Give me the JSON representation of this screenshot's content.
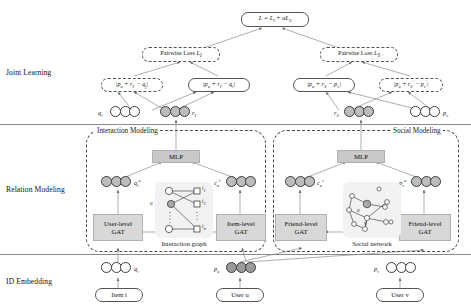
{
  "figure": {
    "type": "neural-network-architecture-diagram",
    "stages": [
      {
        "id": "joint-learning",
        "label": "Joint Learning"
      },
      {
        "id": "relation-modeling",
        "label": "Relation Modeling"
      },
      {
        "id": "id-embedding",
        "label": "ID Embedding"
      }
    ]
  },
  "joint_learning": {
    "total_loss": {
      "text": "L = L_I + αL_S",
      "html": "L = L<sub>I</sub> + αL<sub>S</sub>"
    },
    "losses": [
      {
        "id": "pairwise-loss-interaction",
        "text": "Pairwise Loss L_I",
        "label": "Pairwise Loss",
        "sub": "I"
      },
      {
        "id": "pairwise-loss-social",
        "text": "Pairwise Loss L_S",
        "label": "Pairwise Loss",
        "sub": "S"
      }
    ],
    "translation_terms": [
      {
        "id": "term-interaction-neg",
        "text": "|p_u + r_I' - q_j|",
        "style": "dashed"
      },
      {
        "id": "term-interaction-pos",
        "text": "|p_u + r_I - q_i|",
        "style": "solid"
      },
      {
        "id": "term-social-pos",
        "text": "|p_u + r_S - p_v|",
        "style": "solid"
      },
      {
        "id": "term-social-neg",
        "text": "|p_u + r_S' - p_v'|",
        "style": "dashed"
      }
    ]
  },
  "top_vectors": [
    {
      "id": "vector-q-i",
      "label": "q_i",
      "fill": "white",
      "cells": [
        "white",
        "white",
        "white"
      ],
      "label_side": "left"
    },
    {
      "id": "vector-r-I",
      "label": "r_I",
      "fill": "grey",
      "cells": [
        "grey",
        "grey",
        "grey"
      ],
      "label_side": "right"
    },
    {
      "id": "vector-r-S",
      "label": "r_S",
      "fill": "grey",
      "cells": [
        "grey",
        "grey",
        "grey"
      ],
      "label_side": "left"
    },
    {
      "id": "vector-p-v",
      "label": "p_v",
      "fill": "white",
      "cells": [
        "white",
        "white",
        "white"
      ],
      "label_side": "right"
    }
  ],
  "modules": [
    {
      "id": "interaction-modeling",
      "title": "Interaction Modeling"
    },
    {
      "id": "social-modeling",
      "title": "Social Modeling"
    }
  ],
  "mlp": [
    {
      "id": "mlp-interaction",
      "label": "MLP"
    },
    {
      "id": "mlp-social",
      "label": "MLP"
    }
  ],
  "gat_blocks": [
    {
      "id": "gat-user-level",
      "line1": "User-level",
      "line2": "GAT"
    },
    {
      "id": "gat-item-level",
      "line1": "Item-level",
      "line2": "GAT"
    },
    {
      "id": "gat-friend-level-left",
      "line1": "Friend-level",
      "line2": "GAT"
    },
    {
      "id": "gat-friend-level-right",
      "line1": "Friend-level",
      "line2": "GAT"
    }
  ],
  "mid_vectors": [
    {
      "id": "vector-q-i-u",
      "label": "q_i^u",
      "cells": [
        "grey",
        "grey",
        "grey"
      ],
      "label_side": "right"
    },
    {
      "id": "vector-c-u-i",
      "label": "c_u^i",
      "cells": [
        "grey",
        "grey",
        "grey"
      ],
      "label_side": "left"
    },
    {
      "id": "vector-c-u-s",
      "label": "c_u^s",
      "cells": [
        "grey",
        "grey",
        "grey"
      ],
      "label_side": "right"
    },
    {
      "id": "vector-p-v-u",
      "label": "p_v^u",
      "cells": [
        "grey",
        "grey",
        "grey"
      ],
      "label_side": "left"
    }
  ],
  "graph_panels": [
    {
      "id": "interaction-graph",
      "caption": "Interaction graph",
      "user_node_label": "u",
      "item_node_labels": [
        "i_1",
        "i_2",
        "i_n"
      ]
    },
    {
      "id": "social-network",
      "caption": "Social network",
      "center_node_label": "u",
      "secondary_node_label": "v"
    }
  ],
  "bottom_vectors": [
    {
      "id": "vector-q-i-base",
      "label": "q_i",
      "cells": [
        "white",
        "white",
        "white"
      ],
      "label_side": "right"
    },
    {
      "id": "vector-p-u-base",
      "label": "p_u",
      "cells": [
        "dark",
        "dark",
        "dark"
      ],
      "label_side": "left"
    },
    {
      "id": "vector-p-v-base",
      "label": "p_v",
      "cells": [
        "white",
        "white",
        "white"
      ],
      "label_side": "left"
    }
  ],
  "id_inputs": [
    {
      "id": "input-item-i",
      "label": "Item i"
    },
    {
      "id": "input-user-u",
      "label": "User u"
    },
    {
      "id": "input-user-v",
      "label": "User v"
    }
  ],
  "colors": {
    "grey_box": "#c9c9c9",
    "panel_bg": "#f2f2f2",
    "cell_white": "#ffffff",
    "cell_grey": "#bdbdbd",
    "cell_dark": "#9a9a9a",
    "stroke": "#4a4a4a"
  }
}
